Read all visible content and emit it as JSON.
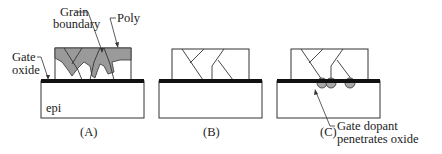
{
  "diagram": {
    "panels": [
      {
        "id": "A",
        "caption": "(A)"
      },
      {
        "id": "B",
        "caption": "(B)"
      },
      {
        "id": "C",
        "caption": "(C)"
      }
    ],
    "labels": {
      "grain_boundary_line1": "Grain",
      "grain_boundary_line2": "boundary",
      "poly": "Poly",
      "gate_oxide_line1": "Gate",
      "gate_oxide_line2": "oxide",
      "epi": "epi",
      "dopant_line1": "Gate dopant",
      "dopant_line2": "penetrates oxide"
    },
    "colors": {
      "poly_fill": "#9a9a9a",
      "oxide": "#111111",
      "outline": "#333333",
      "dopant_fill": "#a8a8a8"
    }
  }
}
